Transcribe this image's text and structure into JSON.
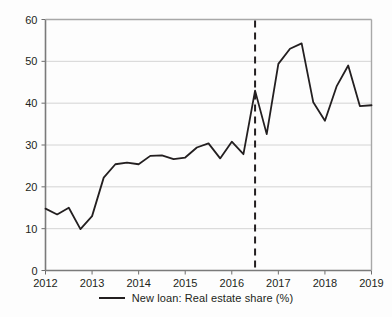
{
  "chart_data": {
    "type": "line",
    "title": "",
    "xlabel": "",
    "ylabel": "",
    "xlim": [
      2012.0,
      2019.0
    ],
    "ylim": [
      0,
      60
    ],
    "grid": true,
    "legend_position": "bottom-center",
    "y_ticks": [
      0,
      10,
      20,
      30,
      40,
      50,
      60
    ],
    "x_ticks": [
      2012,
      2013,
      2014,
      2015,
      2016,
      2017,
      2018,
      2019
    ],
    "y_tick_labels": [
      "0",
      "10",
      "20",
      "30",
      "40",
      "50",
      "60"
    ],
    "x_tick_labels": [
      "2012",
      "2013",
      "2014",
      "2015",
      "2016",
      "2017",
      "2018",
      "2019"
    ],
    "series": [
      {
        "name": "New loan: Real estate share (%)",
        "color": "#231f20",
        "x": [
          2012.0,
          2012.25,
          2012.5,
          2012.75,
          2013.0,
          2013.25,
          2013.5,
          2013.75,
          2014.0,
          2014.25,
          2014.5,
          2014.75,
          2015.0,
          2015.25,
          2015.5,
          2015.75,
          2016.0,
          2016.25,
          2016.5,
          2016.75,
          2017.0,
          2017.25,
          2017.5,
          2017.75,
          2018.0,
          2018.25,
          2018.5,
          2018.75,
          2019.0
        ],
        "values": [
          14.8,
          13.4,
          15.0,
          9.9,
          13.0,
          22.2,
          25.4,
          25.8,
          25.4,
          27.4,
          27.5,
          26.6,
          27.0,
          29.4,
          30.4,
          26.8,
          30.8,
          27.8,
          43.0,
          32.6,
          49.4,
          53.0,
          54.3,
          40.2,
          35.8,
          44.0,
          49.0,
          39.3,
          39.5
        ]
      }
    ],
    "annotations": [
      {
        "type": "vertical-dashed-line",
        "x": 2016.5,
        "color": "#231f20",
        "name": "event-marker"
      }
    ]
  },
  "legend": {
    "entries": [
      {
        "label": "New loan: Real estate share (%)",
        "color": "#231f20"
      }
    ]
  }
}
